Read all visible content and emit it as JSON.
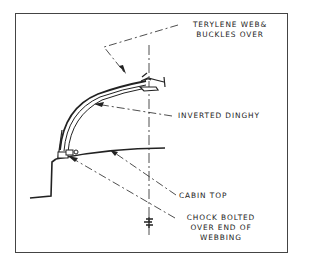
{
  "diagram": {
    "labels": {
      "webbing_line1": "TERYLENE WEB&",
      "webbing_line2": "BUCKLES OVER",
      "dinghy": "INVERTED DINGHY",
      "cabin_top": "CABIN TOP",
      "chock_line1": "CHOCK BOLTED",
      "chock_line2": "OVER END OF",
      "chock_line3": "WEBBING"
    },
    "colors": {
      "ink": "#222222",
      "frame": "#444444",
      "background": "#ffffff"
    }
  }
}
